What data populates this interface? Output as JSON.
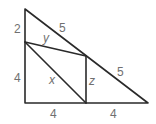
{
  "diagram": {
    "line_color": "#2a2a2a",
    "label_color": "#707070",
    "labels": {
      "left_top": "2",
      "left_bottom": "4",
      "hyp_top": "5",
      "hyp_bottom": "5",
      "bottom_left": "4",
      "bottom_right": "4",
      "x": "x",
      "y": "y",
      "z": "z"
    }
  }
}
